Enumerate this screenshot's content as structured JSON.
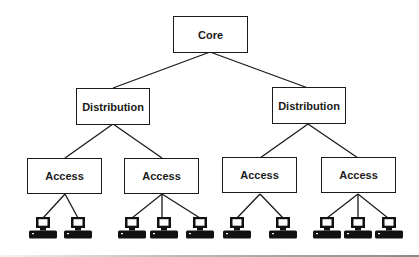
{
  "diagram": {
    "core": {
      "label": "Core"
    },
    "distribution": [
      {
        "label": "Distribution"
      },
      {
        "label": "Distribution"
      }
    ],
    "access": [
      {
        "label": "Access",
        "computers": 2
      },
      {
        "label": "Access",
        "computers": 3
      },
      {
        "label": "Access",
        "computers": 2
      },
      {
        "label": "Access",
        "computers": 3
      }
    ],
    "icons": {
      "end_device": "desktop-computer-icon"
    },
    "colors": {
      "line": "#1a1a1a",
      "box_fill": "#ffffff",
      "background": "#ffffff"
    }
  }
}
